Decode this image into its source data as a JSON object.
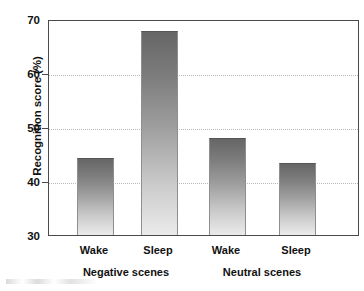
{
  "chart_data": {
    "type": "bar",
    "title": "",
    "xlabel": "",
    "ylabel": "Recognition score (%)",
    "ylim": [
      30,
      70
    ],
    "yticks": [
      30,
      40,
      50,
      60,
      70
    ],
    "ytick_labels": [
      "30",
      "40",
      "50",
      "60",
      "70"
    ],
    "grid": "horizontal-dotted",
    "legend": "none",
    "categories": [
      "Wake",
      "Sleep",
      "Wake",
      "Sleep"
    ],
    "groups": [
      {
        "label": "Negative scenes",
        "categories": [
          "Wake",
          "Sleep"
        ],
        "values": [
          44.4,
          68.1
        ]
      },
      {
        "label": "Neutral scenes",
        "categories": [
          "Wake",
          "Sleep"
        ],
        "values": [
          48.2,
          43.5
        ]
      }
    ],
    "values": [
      44.4,
      68.1,
      48.2,
      43.5
    ],
    "bar_style": "vertical gradient dark-gray top to light-gray bottom",
    "colors": {
      "bar_top": "#666666",
      "bar_bottom": "#ebebeb",
      "axis": "#4a4a4a",
      "gridline": "#b9b9b9",
      "text": "#111111",
      "background": "#ffffff"
    }
  },
  "axis": {
    "y_title": "Recognition score (%)",
    "y_tick_labels": [
      "70",
      "60",
      "50",
      "40",
      "30"
    ]
  },
  "x_labels": {
    "bar_labels": [
      "Wake",
      "Sleep",
      "Wake",
      "Sleep"
    ],
    "group_labels": [
      "Negative scenes",
      "Neutral scenes"
    ]
  }
}
